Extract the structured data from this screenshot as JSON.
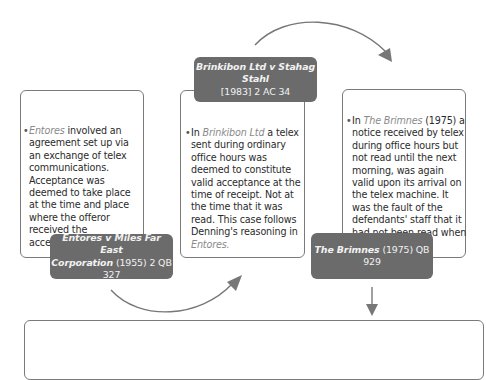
{
  "diagram": {
    "cases": [
      {
        "id": "entores",
        "label": {
          "name": "Entores v Miles Far East Corporation",
          "name_line1": "Entores v Miles Far East",
          "name_line2": "Corporation",
          "citation": "(1955) 2 QB 327"
        },
        "body": {
          "bullet": "•",
          "case_ref": "Entores",
          "text": " involved an agreement set up via an exchange of telex communications. Acceptance was deemed to take place at the time and place where the offeror received the acceptance."
        }
      },
      {
        "id": "brinkibon",
        "label": {
          "name": "Brinkibon Ltd v Stahag Stahl",
          "citation": "[1983] 2 AC 34"
        },
        "body": {
          "bullet": "•",
          "prefix": "In ",
          "case_ref": "Brinkibon Ltd",
          "text": " a telex sent during ordinary office hours was deemed to constitute valid acceptance at the time of receipt. Not at the time that it was read. This case follows Denning's reasoning in ",
          "case_ref_end": "Entores",
          "suffix": "."
        }
      },
      {
        "id": "brimnes",
        "label": {
          "name": "The Brimnes",
          "citation": "(1975) QB 929"
        },
        "body": {
          "bullet": "•",
          "prefix": "In ",
          "case_ref": "The Brimnes",
          "text": " (1975) a notice received by telex during office hours but not read until the next morning, was again valid upon its arrival on the telex machine. It was the fault of the defendants' staff that it had not been read when it arrived."
        }
      }
    ],
    "colors": {
      "label_bg": "#6b6b6b",
      "label_text": "#f2f2f2",
      "border": "#7a7a7a",
      "arrow": "#777777",
      "case_ref": "#8a8a8a",
      "body_text": "#2b2b2b"
    },
    "connectors": [
      {
        "from": "entores",
        "to": "brinkibon",
        "shape": "curved-arrow"
      },
      {
        "from": "brinkibon",
        "to": "brimnes",
        "shape": "curved-arrow"
      },
      {
        "from": "brimnes",
        "to": "summary",
        "shape": "straight-arrow-down"
      }
    ]
  }
}
